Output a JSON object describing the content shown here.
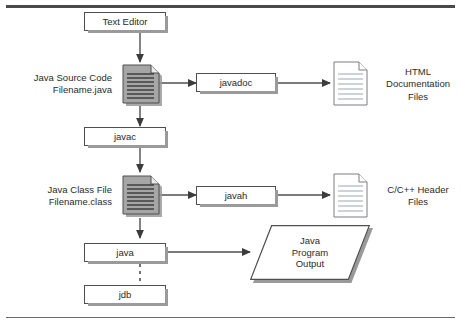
{
  "diagram": {
    "colors": {
      "line": "#4f4f4f",
      "shadow": "#9a9a9a",
      "doc_fill_shaded": "#9e9e9e",
      "doc_fill_plain": "#ffffff",
      "doc_rule": "#8f9ba6",
      "text": "#2b2b2b",
      "rule": "#4a4a4a"
    },
    "nodes": {
      "text_editor": {
        "label": "Text Editor",
        "shape": "process"
      },
      "javadoc": {
        "label": "javadoc",
        "shape": "process"
      },
      "javac": {
        "label": "javac",
        "shape": "process"
      },
      "javah": {
        "label": "javah",
        "shape": "process"
      },
      "java": {
        "label": "java",
        "shape": "process"
      },
      "jdb": {
        "label": "jdb",
        "shape": "process"
      },
      "java_source": {
        "shape": "document-shaded",
        "label_lines": [
          "Java Source Code",
          "Filename.java"
        ]
      },
      "java_class": {
        "shape": "document-shaded",
        "label_lines": [
          "Java Class File",
          "Filename.class"
        ]
      },
      "html_docs": {
        "shape": "document-plain",
        "label_lines": [
          "HTML",
          "Documentation",
          "Files"
        ]
      },
      "c_headers": {
        "shape": "document-plain",
        "label_lines": [
          "C/C++ Header",
          "Files"
        ]
      },
      "program_output": {
        "shape": "parallelogram",
        "label_lines": [
          "Java",
          "Program",
          "Output"
        ]
      }
    },
    "edges": [
      {
        "from": "text_editor",
        "to": "java_source",
        "style": "solid-arrow"
      },
      {
        "from": "java_source",
        "to": "javadoc",
        "style": "solid-arrow"
      },
      {
        "from": "javadoc",
        "to": "html_docs",
        "style": "solid-arrow"
      },
      {
        "from": "java_source",
        "to": "javac",
        "style": "solid-arrow"
      },
      {
        "from": "javac",
        "to": "java_class",
        "style": "solid-arrow"
      },
      {
        "from": "java_class",
        "to": "javah",
        "style": "solid-arrow"
      },
      {
        "from": "javah",
        "to": "c_headers",
        "style": "solid-arrow"
      },
      {
        "from": "java_class",
        "to": "java",
        "style": "solid-arrow"
      },
      {
        "from": "java",
        "to": "program_output",
        "style": "solid-arrow"
      },
      {
        "from": "java",
        "to": "jdb",
        "style": "dashed"
      }
    ]
  }
}
